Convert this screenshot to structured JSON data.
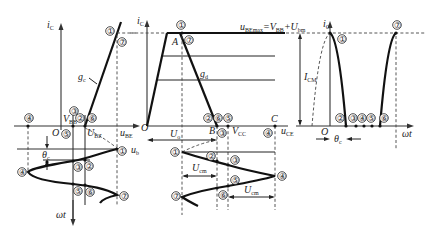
{
  "diagram": {
    "panel_left": {
      "y_axis_label": "i",
      "y_axis_sub": "C",
      "x_axis_label": "u",
      "x_axis_sub": "BE",
      "origin": "O",
      "line_label": "g",
      "line_label_sub": "c",
      "vbb_label": "V",
      "vbb_sub": "BB",
      "ubz_label": "U",
      "ubz_sub": "BZ",
      "theta_label": "θ",
      "theta_sub": "c",
      "ub_label": "u",
      "ub_sub": "b",
      "time_label": "ωt",
      "points": [
        "①",
        "②",
        "③",
        "④",
        "⑤",
        "⑥",
        "⑦"
      ]
    },
    "panel_middle": {
      "y_axis_label": "i",
      "y_axis_sub": "C",
      "x_axis_label": "u",
      "x_axis_sub": "CE",
      "origin": "O",
      "point_A": "A",
      "point_B": "B",
      "point_C": "C",
      "gd_label": "g",
      "gd_sub": "d",
      "ube_max_label": "u",
      "ube_max_sub": "BEmax",
      "ube_max_eq": "=V",
      "ube_max_eq_sub": "BB",
      "ube_max_plus": "+U",
      "ube_max_plus_sub": "bm",
      "uo_label": "U",
      "uo_sub": "o",
      "vcc_label": "V",
      "vcc_sub": "CC",
      "ucm_label": "U",
      "ucm_sub": "cm",
      "points": [
        "①",
        "②",
        "③",
        "④",
        "⑤",
        "⑥",
        "⑦"
      ]
    },
    "panel_right": {
      "y_axis_label": "i",
      "y_axis_sub": "C",
      "icm_label": "I",
      "icm_sub": "CM",
      "origin": "O",
      "theta_label": "θ",
      "theta_sub": "c",
      "time_label": "ωt",
      "points": [
        "①",
        "②",
        "③",
        "④",
        "⑤",
        "⑥",
        "⑦"
      ]
    }
  }
}
